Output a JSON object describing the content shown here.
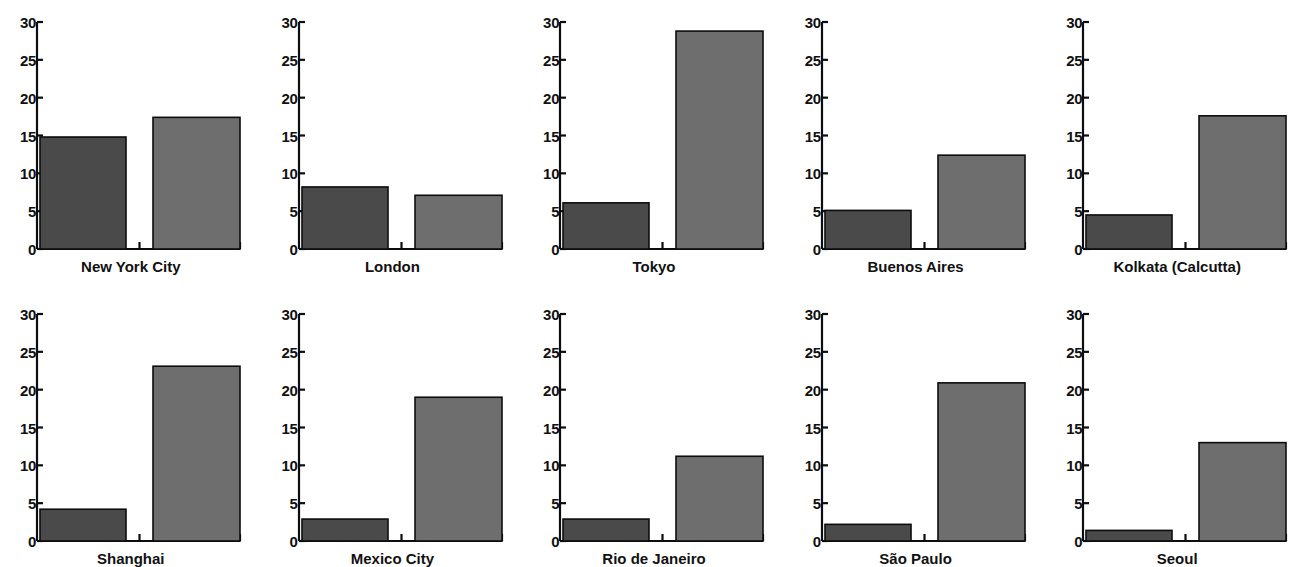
{
  "chart_data": {
    "type": "bar",
    "title": "",
    "xlabel": "",
    "ylabel": "",
    "ylim": [
      0,
      30
    ],
    "yticks": [
      0,
      5,
      10,
      15,
      20,
      25,
      30
    ],
    "grid": false,
    "legend": "none",
    "layout": {
      "rows": 2,
      "cols": 5
    },
    "categories": [
      "New York City",
      "London",
      "Tokyo",
      "Buenos Aires",
      "Kolkata (Calcutta)",
      "Shanghai",
      "Mexico City",
      "Rio de Janeiro",
      "São Paulo",
      "Seoul"
    ],
    "series": [
      {
        "name": "bar-1",
        "color": "#4a4a4a",
        "values": [
          14.8,
          8.2,
          6.1,
          5.1,
          4.5,
          4.2,
          2.9,
          2.9,
          2.2,
          1.4
        ]
      },
      {
        "name": "bar-2",
        "color": "#6e6e6e",
        "values": [
          17.4,
          7.1,
          28.8,
          12.4,
          17.6,
          23.1,
          19.0,
          11.2,
          20.9,
          13.0
        ]
      }
    ],
    "panels": [
      {
        "label": "New York City",
        "row": 1,
        "col": 1,
        "bar1": 14.8,
        "bar2": 17.4
      },
      {
        "label": "London",
        "row": 1,
        "col": 2,
        "bar1": 8.2,
        "bar2": 7.1
      },
      {
        "label": "Tokyo",
        "row": 1,
        "col": 3,
        "bar1": 6.1,
        "bar2": 28.8
      },
      {
        "label": "Buenos Aires",
        "row": 1,
        "col": 4,
        "bar1": 5.1,
        "bar2": 12.4
      },
      {
        "label": "Kolkata (Calcutta)",
        "row": 1,
        "col": 5,
        "bar1": 4.5,
        "bar2": 17.6
      },
      {
        "label": "Shanghai",
        "row": 2,
        "col": 1,
        "bar1": 4.2,
        "bar2": 23.1
      },
      {
        "label": "Mexico City",
        "row": 2,
        "col": 2,
        "bar1": 2.9,
        "bar2": 19.0
      },
      {
        "label": "Rio de Janeiro",
        "row": 2,
        "col": 3,
        "bar1": 2.9,
        "bar2": 11.2
      },
      {
        "label": "São Paulo",
        "row": 2,
        "col": 4,
        "bar1": 2.2,
        "bar2": 20.9
      },
      {
        "label": "Seoul",
        "row": 2,
        "col": 5,
        "bar1": 1.4,
        "bar2": 13.0
      }
    ]
  },
  "axis": {
    "tick_labels": [
      "30",
      "25",
      "20",
      "15",
      "10",
      "5",
      "0"
    ],
    "min": 0,
    "max": 30
  },
  "colors": {
    "bar_dark": "#4a4a4a",
    "bar_light": "#6e6e6e",
    "axis": "#0d0d0d",
    "background": "#ffffff",
    "text": "#111111"
  }
}
